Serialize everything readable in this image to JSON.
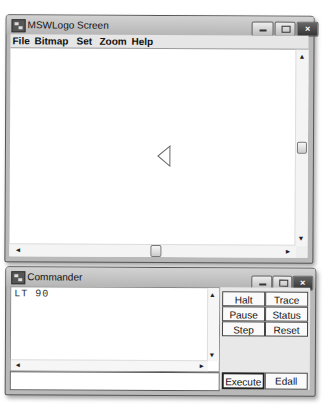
{
  "screen_window": {
    "title": "MSWLogo Screen",
    "controls": {
      "minimize": "minimize-icon",
      "maximize": "maximize-icon",
      "close": "×"
    },
    "menu": [
      {
        "label": "File"
      },
      {
        "label": "Bitmap"
      },
      {
        "label": "Set"
      },
      {
        "label": "Zoom"
      },
      {
        "label": "Help"
      }
    ],
    "scroll": {
      "up": "▲",
      "down": "▼",
      "left": "◄",
      "right": "►"
    },
    "turtle": {
      "shape": "triangle",
      "heading": "left-pointing"
    }
  },
  "commander_window": {
    "title": "Commander",
    "controls": {
      "close": "×"
    },
    "history": [
      "LT 90"
    ],
    "input_value": "",
    "scroll": {
      "up": "▲",
      "down": "▼",
      "left": "◄",
      "right": "►"
    },
    "buttons": {
      "halt": "Halt",
      "trace": "Trace",
      "pause": "Pause",
      "status": "Status",
      "step": "Step",
      "reset": "Reset",
      "execute": "Execute",
      "edall": "Edall"
    }
  },
  "colors": {
    "frame": "#b9b9b9",
    "canvas": "#ffffff",
    "close_button": "#444444"
  }
}
